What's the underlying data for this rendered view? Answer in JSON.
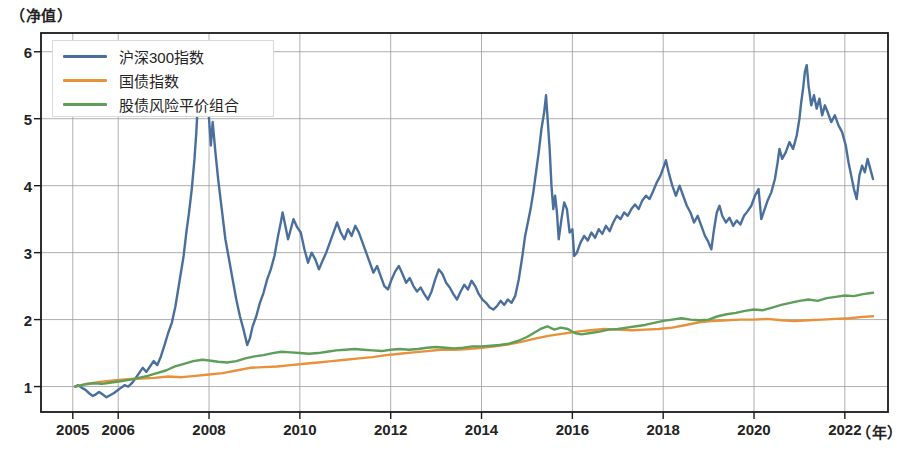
{
  "axis": {
    "y_unit_label": "（净值）",
    "x_unit_label": "（年）",
    "y_ticks": [
      1,
      2,
      3,
      4,
      5,
      6
    ],
    "x_ticks": [
      2005,
      2006,
      2008,
      2010,
      2012,
      2014,
      2016,
      2018,
      2020,
      2022
    ]
  },
  "legend": {
    "items": [
      {
        "label": "沪深300指数",
        "color": "#4a6f9c"
      },
      {
        "label": "国债指数",
        "color": "#e8903a"
      },
      {
        "label": "股债风险平价组合",
        "color": "#5d9e58"
      }
    ]
  },
  "chart_data": {
    "type": "line",
    "title": "",
    "xlabel": "（年）",
    "ylabel": "（净值）",
    "xlim": [
      2004.3,
      2022.95
    ],
    "ylim": [
      0.62,
      6.28
    ],
    "grid": true,
    "legend_position": "upper-left",
    "x_tick_labels": [
      "2005",
      "2006",
      "2008",
      "2010",
      "2012",
      "2014",
      "2016",
      "2018",
      "2020",
      "2022"
    ],
    "y_tick_labels": [
      "1",
      "2",
      "3",
      "4",
      "5",
      "6"
    ],
    "series": [
      {
        "name": "沪深300指数",
        "color": "#4a6f9c",
        "x": [
          2005.05,
          2005.12,
          2005.2,
          2005.28,
          2005.36,
          2005.44,
          2005.5,
          2005.58,
          2005.66,
          2005.74,
          2005.82,
          2005.9,
          2005.98,
          2006.06,
          2006.14,
          2006.22,
          2006.3,
          2006.38,
          2006.46,
          2006.54,
          2006.62,
          2006.7,
          2006.78,
          2006.86,
          2006.94,
          2007.02,
          2007.1,
          2007.18,
          2007.26,
          2007.32,
          2007.38,
          2007.44,
          2007.5,
          2007.56,
          2007.62,
          2007.68,
          2007.72,
          2007.76,
          2007.8,
          2007.84,
          2007.88,
          2007.92,
          2007.96,
          2008.0,
          2008.04,
          2008.08,
          2008.14,
          2008.2,
          2008.28,
          2008.36,
          2008.44,
          2008.52,
          2008.6,
          2008.68,
          2008.76,
          2008.84,
          2008.9,
          2008.96,
          2009.04,
          2009.12,
          2009.2,
          2009.28,
          2009.36,
          2009.44,
          2009.52,
          2009.58,
          2009.62,
          2009.68,
          2009.74,
          2009.8,
          2009.86,
          2009.94,
          2010.02,
          2010.1,
          2010.18,
          2010.26,
          2010.34,
          2010.42,
          2010.5,
          2010.58,
          2010.66,
          2010.74,
          2010.82,
          2010.9,
          2010.98,
          2011.06,
          2011.14,
          2011.22,
          2011.3,
          2011.38,
          2011.46,
          2011.54,
          2011.62,
          2011.7,
          2011.78,
          2011.86,
          2011.94,
          2012.02,
          2012.1,
          2012.18,
          2012.26,
          2012.34,
          2012.42,
          2012.5,
          2012.58,
          2012.66,
          2012.74,
          2012.82,
          2012.9,
          2012.98,
          2013.06,
          2013.14,
          2013.22,
          2013.3,
          2013.38,
          2013.46,
          2013.54,
          2013.62,
          2013.7,
          2013.78,
          2013.86,
          2013.94,
          2014.02,
          2014.1,
          2014.18,
          2014.26,
          2014.34,
          2014.42,
          2014.5,
          2014.58,
          2014.66,
          2014.74,
          2014.82,
          2014.9,
          2014.96,
          2015.02,
          2015.08,
          2015.14,
          2015.2,
          2015.26,
          2015.32,
          2015.38,
          2015.42,
          2015.46,
          2015.5,
          2015.54,
          2015.58,
          2015.62,
          2015.66,
          2015.7,
          2015.76,
          2015.82,
          2015.88,
          2015.94,
          2016.0,
          2016.04,
          2016.1,
          2016.18,
          2016.26,
          2016.34,
          2016.42,
          2016.5,
          2016.58,
          2016.66,
          2016.74,
          2016.82,
          2016.9,
          2016.98,
          2017.06,
          2017.14,
          2017.22,
          2017.3,
          2017.38,
          2017.46,
          2017.54,
          2017.62,
          2017.7,
          2017.78,
          2017.86,
          2017.94,
          2018.02,
          2018.06,
          2018.12,
          2018.2,
          2018.28,
          2018.36,
          2018.44,
          2018.52,
          2018.6,
          2018.68,
          2018.76,
          2018.84,
          2018.92,
          2018.98,
          2019.06,
          2019.12,
          2019.18,
          2019.24,
          2019.3,
          2019.38,
          2019.46,
          2019.54,
          2019.62,
          2019.7,
          2019.78,
          2019.86,
          2019.94,
          2020.02,
          2020.1,
          2020.16,
          2020.22,
          2020.3,
          2020.38,
          2020.46,
          2020.52,
          2020.56,
          2020.62,
          2020.7,
          2020.78,
          2020.86,
          2020.94,
          2021.0,
          2021.04,
          2021.08,
          2021.12,
          2021.16,
          2021.2,
          2021.26,
          2021.32,
          2021.38,
          2021.44,
          2021.5,
          2021.56,
          2021.62,
          2021.7,
          2021.78,
          2021.86,
          2021.94,
          2022.02,
          2022.08,
          2022.14,
          2022.2,
          2022.26,
          2022.32,
          2022.38,
          2022.44,
          2022.5,
          2022.56,
          2022.62
        ],
        "y": [
          1.0,
          1.02,
          0.98,
          0.95,
          0.9,
          0.86,
          0.88,
          0.92,
          0.88,
          0.84,
          0.87,
          0.9,
          0.94,
          0.98,
          1.02,
          1.0,
          1.05,
          1.12,
          1.2,
          1.28,
          1.22,
          1.3,
          1.38,
          1.32,
          1.45,
          1.62,
          1.8,
          1.95,
          2.2,
          2.45,
          2.7,
          2.95,
          3.3,
          3.6,
          3.95,
          4.4,
          4.8,
          5.3,
          5.9,
          5.45,
          5.1,
          5.7,
          5.35,
          5.0,
          4.6,
          4.95,
          4.5,
          4.1,
          3.65,
          3.2,
          2.9,
          2.6,
          2.3,
          2.05,
          1.85,
          1.62,
          1.72,
          1.9,
          2.05,
          2.25,
          2.4,
          2.6,
          2.75,
          2.95,
          3.25,
          3.45,
          3.6,
          3.4,
          3.2,
          3.35,
          3.5,
          3.38,
          3.3,
          3.05,
          2.85,
          3.0,
          2.9,
          2.75,
          2.88,
          3.0,
          3.15,
          3.3,
          3.45,
          3.3,
          3.2,
          3.35,
          3.25,
          3.4,
          3.3,
          3.15,
          3.0,
          2.85,
          2.7,
          2.8,
          2.65,
          2.5,
          2.45,
          2.6,
          2.72,
          2.8,
          2.68,
          2.55,
          2.62,
          2.5,
          2.42,
          2.48,
          2.38,
          2.3,
          2.42,
          2.6,
          2.75,
          2.68,
          2.55,
          2.48,
          2.38,
          2.3,
          2.42,
          2.52,
          2.45,
          2.58,
          2.5,
          2.38,
          2.3,
          2.25,
          2.18,
          2.15,
          2.2,
          2.28,
          2.22,
          2.3,
          2.25,
          2.35,
          2.6,
          2.95,
          3.25,
          3.45,
          3.65,
          3.9,
          4.2,
          4.5,
          4.85,
          5.1,
          5.35,
          4.95,
          4.55,
          4.0,
          3.65,
          3.85,
          3.6,
          3.2,
          3.5,
          3.75,
          3.65,
          3.3,
          3.35,
          2.95,
          3.0,
          3.15,
          3.25,
          3.18,
          3.3,
          3.22,
          3.35,
          3.28,
          3.4,
          3.32,
          3.45,
          3.55,
          3.5,
          3.6,
          3.55,
          3.65,
          3.72,
          3.65,
          3.78,
          3.85,
          3.8,
          3.92,
          4.05,
          4.15,
          4.3,
          4.38,
          4.2,
          4.0,
          3.85,
          4.0,
          3.85,
          3.7,
          3.6,
          3.45,
          3.55,
          3.4,
          3.25,
          3.18,
          3.05,
          3.35,
          3.6,
          3.7,
          3.55,
          3.45,
          3.52,
          3.4,
          3.48,
          3.42,
          3.55,
          3.62,
          3.7,
          3.85,
          3.95,
          3.5,
          3.62,
          3.78,
          3.9,
          4.1,
          4.35,
          4.55,
          4.4,
          4.5,
          4.65,
          4.55,
          4.75,
          5.0,
          5.25,
          5.45,
          5.7,
          5.8,
          5.5,
          5.2,
          5.35,
          5.15,
          5.3,
          5.05,
          5.2,
          5.1,
          4.95,
          5.05,
          4.9,
          4.8,
          4.6,
          4.35,
          4.15,
          3.95,
          3.8,
          4.15,
          4.3,
          4.2,
          4.4,
          4.25,
          4.1
        ]
      },
      {
        "name": "国债指数",
        "color": "#e8903a",
        "x": [
          2005.05,
          2005.3,
          2005.6,
          2005.9,
          2006.2,
          2006.5,
          2006.8,
          2007.1,
          2007.4,
          2007.7,
          2008.0,
          2008.3,
          2008.6,
          2008.9,
          2009.2,
          2009.5,
          2009.8,
          2010.1,
          2010.4,
          2010.7,
          2011.0,
          2011.3,
          2011.6,
          2011.9,
          2012.2,
          2012.5,
          2012.8,
          2013.1,
          2013.4,
          2013.7,
          2014.0,
          2014.3,
          2014.6,
          2014.9,
          2015.2,
          2015.5,
          2015.8,
          2016.1,
          2016.4,
          2016.7,
          2017.0,
          2017.3,
          2017.6,
          2017.9,
          2018.2,
          2018.5,
          2018.8,
          2019.1,
          2019.4,
          2019.7,
          2020.0,
          2020.3,
          2020.6,
          2020.9,
          2021.2,
          2021.5,
          2021.8,
          2022.1,
          2022.4,
          2022.62
        ],
        "y": [
          1.0,
          1.04,
          1.07,
          1.09,
          1.11,
          1.12,
          1.13,
          1.15,
          1.14,
          1.16,
          1.18,
          1.2,
          1.24,
          1.28,
          1.29,
          1.3,
          1.32,
          1.34,
          1.36,
          1.38,
          1.4,
          1.42,
          1.44,
          1.47,
          1.49,
          1.51,
          1.53,
          1.55,
          1.55,
          1.56,
          1.58,
          1.6,
          1.63,
          1.67,
          1.72,
          1.76,
          1.79,
          1.82,
          1.84,
          1.86,
          1.85,
          1.84,
          1.85,
          1.86,
          1.88,
          1.92,
          1.96,
          1.98,
          1.99,
          2.0,
          2.0,
          2.01,
          1.99,
          1.98,
          1.99,
          2.0,
          2.01,
          2.02,
          2.04,
          2.05
        ]
      },
      {
        "name": "股债风险平价组合",
        "color": "#5d9e58",
        "x": [
          2005.05,
          2005.25,
          2005.45,
          2005.65,
          2005.85,
          2006.05,
          2006.25,
          2006.45,
          2006.65,
          2006.85,
          2007.05,
          2007.25,
          2007.45,
          2007.65,
          2007.85,
          2008.0,
          2008.2,
          2008.4,
          2008.6,
          2008.8,
          2009.0,
          2009.2,
          2009.4,
          2009.6,
          2009.8,
          2010.0,
          2010.2,
          2010.4,
          2010.6,
          2010.8,
          2011.0,
          2011.2,
          2011.4,
          2011.6,
          2011.8,
          2012.0,
          2012.2,
          2012.4,
          2012.6,
          2012.8,
          2013.0,
          2013.2,
          2013.4,
          2013.6,
          2013.8,
          2014.0,
          2014.2,
          2014.4,
          2014.6,
          2014.8,
          2015.0,
          2015.15,
          2015.3,
          2015.45,
          2015.6,
          2015.75,
          2015.9,
          2016.05,
          2016.2,
          2016.4,
          2016.6,
          2016.8,
          2017.0,
          2017.2,
          2017.4,
          2017.6,
          2017.8,
          2018.0,
          2018.2,
          2018.4,
          2018.6,
          2018.8,
          2019.0,
          2019.2,
          2019.4,
          2019.6,
          2019.8,
          2020.0,
          2020.2,
          2020.4,
          2020.6,
          2020.8,
          2021.0,
          2021.2,
          2021.4,
          2021.6,
          2021.8,
          2022.0,
          2022.2,
          2022.4,
          2022.62
        ],
        "y": [
          1.0,
          1.03,
          1.05,
          1.04,
          1.06,
          1.08,
          1.1,
          1.13,
          1.16,
          1.2,
          1.24,
          1.3,
          1.34,
          1.38,
          1.4,
          1.39,
          1.37,
          1.36,
          1.38,
          1.42,
          1.45,
          1.47,
          1.5,
          1.52,
          1.51,
          1.5,
          1.49,
          1.5,
          1.52,
          1.54,
          1.55,
          1.56,
          1.55,
          1.54,
          1.53,
          1.55,
          1.56,
          1.55,
          1.56,
          1.58,
          1.59,
          1.58,
          1.57,
          1.58,
          1.6,
          1.6,
          1.61,
          1.62,
          1.64,
          1.68,
          1.74,
          1.8,
          1.86,
          1.9,
          1.85,
          1.88,
          1.86,
          1.8,
          1.78,
          1.8,
          1.82,
          1.85,
          1.86,
          1.88,
          1.9,
          1.92,
          1.95,
          1.98,
          2.0,
          2.02,
          2.0,
          1.99,
          2.0,
          2.05,
          2.08,
          2.1,
          2.13,
          2.15,
          2.14,
          2.18,
          2.22,
          2.25,
          2.28,
          2.3,
          2.28,
          2.32,
          2.34,
          2.36,
          2.35,
          2.38,
          2.4
        ]
      }
    ]
  }
}
